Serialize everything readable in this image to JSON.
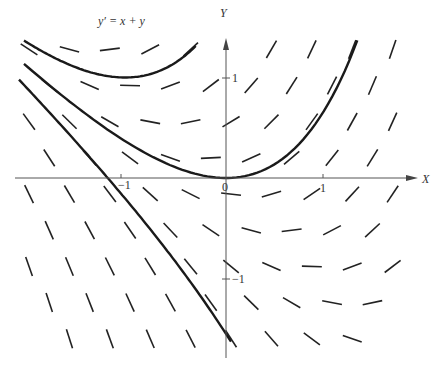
{
  "figure": {
    "equation": "y′ = x + y",
    "x_axis_label": "X",
    "y_axis_label": "Y",
    "origin_label": "0",
    "x_ticks": [
      {
        "value": -1,
        "label": "−1"
      },
      {
        "value": 1,
        "label": "1"
      }
    ],
    "y_ticks": [
      {
        "value": 1,
        "label": "1"
      },
      {
        "value": -1,
        "label": "−1"
      }
    ],
    "colors": {
      "ink": "#222222",
      "axis": "#555555",
      "background": "#ffffff"
    }
  },
  "chart_data": {
    "type": "line",
    "title": "y′ = x + y",
    "xlabel": "X",
    "ylabel": "Y",
    "xlim": [
      -2.1,
      1.95
    ],
    "ylim": [
      -1.8,
      1.4
    ],
    "grid": false,
    "series": [
      {
        "name": "C = e (min at (-1, 1))",
        "C": 2.718,
        "x_range": [
          -2.0,
          -0.3
        ]
      },
      {
        "name": "C = 1 (through origin)",
        "C": 1.0,
        "x_range": [
          -2.0,
          1.3
        ]
      },
      {
        "name": "C ≈ -0.55",
        "C": -0.55,
        "x_range": [
          -2.05,
          0.05
        ]
      }
    ],
    "slope_field": {
      "spacing_x": 0.4,
      "spacing_y": 0.36,
      "slope": "x + y"
    }
  }
}
